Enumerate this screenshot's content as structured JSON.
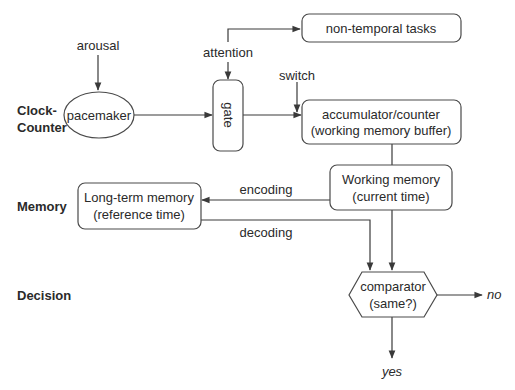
{
  "rows": {
    "clock_counter": [
      "Clock-",
      "Counter"
    ],
    "memory": "Memory",
    "decision": "Decision"
  },
  "nodes": {
    "pacemaker": "pacemaker",
    "gate": "gate",
    "non_temporal": "non-temporal tasks",
    "accumulator": [
      "accumulator/counter",
      "(working memory buffer)"
    ],
    "working_memory": [
      "Working memory",
      "(current time)"
    ],
    "long_term_memory": [
      "Long-term memory",
      "(reference time)"
    ],
    "comparator": [
      "comparator",
      "(same?)"
    ]
  },
  "edge_labels": {
    "arousal": "arousal",
    "attention": "attention",
    "switch": "switch",
    "encoding": "encoding",
    "decoding": "decoding",
    "no": "no",
    "yes": "yes"
  }
}
